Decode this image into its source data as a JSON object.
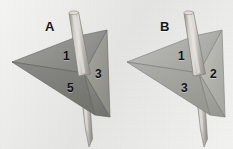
{
  "image": {
    "kind": "figure-two-panels",
    "background_color": "#e9e9e7",
    "panels": [
      "A",
      "B"
    ]
  },
  "panels": [
    {
      "id": "A",
      "label": "A",
      "object_name": "triangular-dart-with-rod",
      "rod": {
        "name": "rod",
        "color_light": "#d6d4cf",
        "color_mid": "#b9b6b0",
        "color_dark": "#8e8b85",
        "tip": "pointed-bottom"
      },
      "faces": [
        {
          "number": "1",
          "position": "upper-left-facet",
          "fill": "#8a8a88"
        },
        {
          "number": "3",
          "position": "right-facet",
          "fill": "#9b9b97"
        },
        {
          "number": "5",
          "position": "lower-left-facet",
          "fill": "#7c7c7a"
        }
      ],
      "face_numbers": [
        "1",
        "3",
        "5"
      ],
      "body_fill": "#8f8f8c"
    },
    {
      "id": "B",
      "label": "B",
      "object_name": "triangular-dart-with-rod",
      "rod": {
        "name": "rod",
        "color_light": "#d9d7d2",
        "color_mid": "#bcb9b3",
        "color_dark": "#918e88",
        "tip": "pointed-bottom"
      },
      "faces": [
        {
          "number": "1",
          "position": "upper-left-facet",
          "fill": "#a8a8a4"
        },
        {
          "number": "2",
          "position": "right-facet",
          "fill": "#b4b4b0"
        },
        {
          "number": "3",
          "position": "lower-left-facet",
          "fill": "#a0a09c"
        }
      ],
      "face_numbers": [
        "1",
        "2",
        "3"
      ],
      "body_fill": "#aaaaa6"
    }
  ]
}
